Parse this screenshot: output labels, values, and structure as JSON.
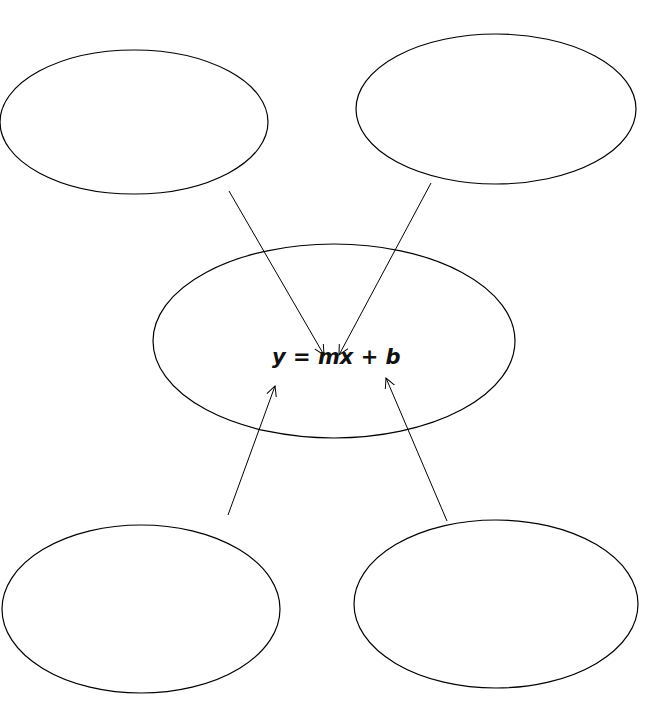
{
  "diagram": {
    "center": {
      "label": "y = mx + b"
    },
    "nodes": [
      {
        "id": "top-left",
        "label": ""
      },
      {
        "id": "top-right",
        "label": ""
      },
      {
        "id": "bottom-left",
        "label": ""
      },
      {
        "id": "bottom-right",
        "label": ""
      }
    ],
    "stroke_color": "#000000"
  }
}
